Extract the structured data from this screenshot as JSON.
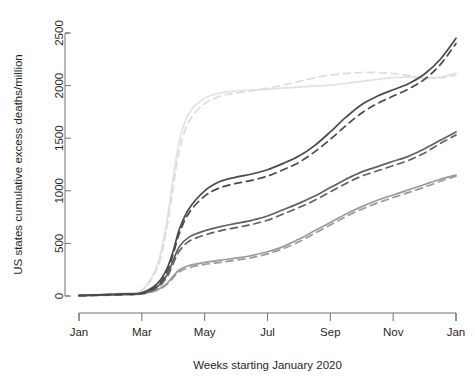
{
  "chart_data": {
    "type": "line",
    "title": "",
    "xlabel": "Weeks starting January 2020",
    "ylabel": "US states cumulative excess deaths/million",
    "xticklabels": [
      "Jan",
      "Mar",
      "May",
      "Jul",
      "Sep",
      "Nov",
      "Jan"
    ],
    "xtickvalues": [
      0,
      2,
      4,
      6,
      8,
      10,
      12
    ],
    "yticklabels": [
      "0",
      "500",
      "1000",
      "1500",
      "2000",
      "2500"
    ],
    "ytickvalues": [
      0,
      500,
      1000,
      1500,
      2000,
      2500
    ],
    "xlim": [
      0,
      12
    ],
    "ylim": [
      0,
      2500
    ],
    "grid": false,
    "legend": "none",
    "x_months": [
      0,
      0.5,
      1,
      1.5,
      2,
      2.5,
      2.8,
      3,
      3.2,
      3.5,
      4,
      4.5,
      5,
      5.5,
      6,
      6.5,
      7,
      7.5,
      8,
      8.5,
      9,
      9.5,
      10,
      10.5,
      11,
      11.5,
      12
    ],
    "series": [
      {
        "name": "group-1-solid",
        "color": "#4a4a4a",
        "style": "solid",
        "values": [
          5,
          10,
          15,
          20,
          30,
          120,
          260,
          430,
          640,
          830,
          1000,
          1090,
          1130,
          1160,
          1200,
          1260,
          1330,
          1430,
          1560,
          1700,
          1820,
          1900,
          1960,
          2020,
          2110,
          2250,
          2450
        ]
      },
      {
        "name": "group-1-dashed",
        "color": "#4a4a4a",
        "style": "dashed",
        "values": [
          5,
          8,
          12,
          18,
          28,
          100,
          230,
          400,
          600,
          790,
          950,
          1030,
          1070,
          1100,
          1140,
          1200,
          1270,
          1370,
          1490,
          1620,
          1740,
          1830,
          1900,
          1970,
          2060,
          2200,
          2400
        ]
      },
      {
        "name": "group-2-solid",
        "color": "#616161",
        "style": "solid",
        "values": [
          4,
          8,
          12,
          16,
          24,
          90,
          200,
          340,
          470,
          560,
          620,
          660,
          690,
          720,
          760,
          820,
          880,
          950,
          1030,
          1110,
          1180,
          1230,
          1280,
          1330,
          1400,
          1480,
          1560
        ]
      },
      {
        "name": "group-2-dashed",
        "color": "#616161",
        "style": "dashed",
        "values": [
          4,
          7,
          11,
          15,
          22,
          80,
          180,
          310,
          430,
          520,
          580,
          620,
          650,
          680,
          720,
          780,
          840,
          910,
          990,
          1070,
          1140,
          1190,
          1240,
          1290,
          1360,
          1450,
          1530
        ]
      },
      {
        "name": "group-3-solid",
        "color": "#9a9a9a",
        "style": "solid",
        "values": [
          3,
          6,
          10,
          14,
          20,
          60,
          120,
          190,
          250,
          290,
          320,
          340,
          360,
          385,
          420,
          470,
          540,
          620,
          700,
          780,
          850,
          910,
          960,
          1010,
          1060,
          1110,
          1150
        ]
      },
      {
        "name": "group-3-dashed",
        "color": "#9a9a9a",
        "style": "dashed",
        "values": [
          3,
          5,
          9,
          13,
          19,
          55,
          110,
          175,
          230,
          270,
          300,
          320,
          340,
          365,
          400,
          450,
          515,
          595,
          675,
          755,
          825,
          885,
          935,
          985,
          1035,
          1090,
          1140
        ]
      },
      {
        "name": "group-4-solid",
        "color": "#e2e2e2",
        "style": "solid",
        "values": [
          6,
          12,
          20,
          30,
          55,
          300,
          720,
          1130,
          1480,
          1740,
          1880,
          1930,
          1950,
          1960,
          1965,
          1975,
          1985,
          1995,
          2005,
          2020,
          2040,
          2060,
          2075,
          2080,
          2070,
          2080,
          2120
        ]
      },
      {
        "name": "group-4-dashed",
        "color": "#dcdcdc",
        "style": "dashed",
        "values": [
          6,
          11,
          18,
          28,
          50,
          270,
          650,
          1040,
          1390,
          1660,
          1830,
          1900,
          1930,
          1950,
          1975,
          2005,
          2040,
          2075,
          2100,
          2115,
          2125,
          2125,
          2115,
          2095,
          2075,
          2075,
          2100
        ]
      }
    ]
  },
  "clipped_header": "·  ·  ·"
}
